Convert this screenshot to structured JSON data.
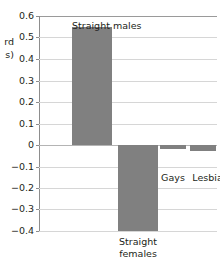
{
  "chart_data": {
    "type": "bar",
    "title": "",
    "xlabel": "",
    "ylabel": "(standard deviations)",
    "ylabel_visible_fragment": "rd\ns)",
    "categories": [
      "Straight males",
      "Straight females",
      "Gays",
      "Lesbians"
    ],
    "values": [
      0.55,
      -0.4,
      -0.02,
      -0.03
    ],
    "ylim": [
      -0.4,
      0.6
    ],
    "ytick_labels": [
      "0.6",
      "0.5",
      "0.4",
      "0.3",
      "0.2",
      "0.1",
      "0",
      "−0.1",
      "−0.2",
      "−0.3",
      "−0.4"
    ],
    "ytick_values": [
      0.6,
      0.5,
      0.4,
      0.3,
      0.2,
      0.1,
      0,
      -0.1,
      -0.2,
      -0.3,
      -0.4
    ],
    "grid": true,
    "legend": "none",
    "bar_color": "#808080",
    "gridline_color": "#d6d6d6",
    "axis_color": "#8d8d8d",
    "annotations": [
      {
        "text": "Straight males",
        "for": "Straight males",
        "position": "above-bar"
      },
      {
        "text": "Straight\nfemales",
        "for": "Straight females",
        "position": "below-axis"
      },
      {
        "text": "Gays",
        "for": "Gays",
        "position": "below-bar"
      },
      {
        "text": "Lesbians",
        "for": "Lesbians",
        "position": "below-bar"
      }
    ]
  }
}
